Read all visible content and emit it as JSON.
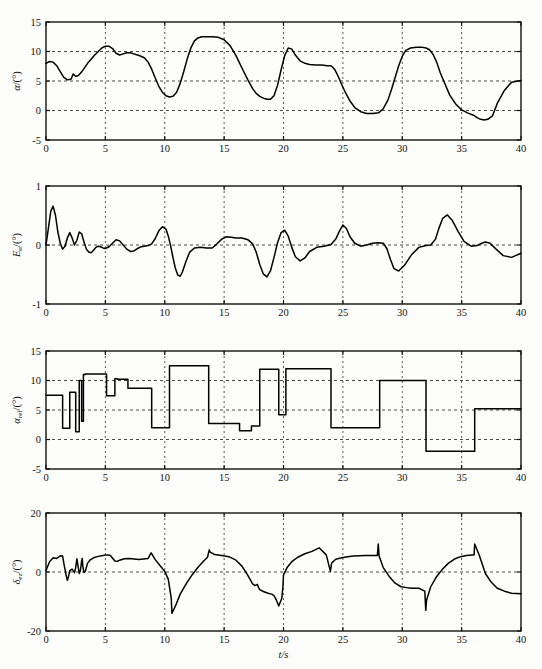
{
  "figure": {
    "width": 542,
    "height": 669,
    "background": "#fdfdfb",
    "line_color": "#000000",
    "grid_color": "#333333",
    "xlabel": "t/s",
    "caption": ""
  },
  "chart_data": [
    {
      "id": "panel-alpha",
      "type": "line",
      "title": "",
      "xlabel": "",
      "ylabel": "α/(°)",
      "ylabel_parts": {
        "base": "α",
        "sub": "",
        "unit": "/(°)"
      },
      "xlim": [
        0,
        40
      ],
      "ylim": [
        -5,
        15
      ],
      "xticks": [
        0,
        5,
        10,
        15,
        20,
        25,
        30,
        35,
        40
      ],
      "yticks": [
        -5,
        0,
        5,
        10,
        15
      ],
      "grid": true,
      "grid_y": [
        0,
        5,
        10
      ],
      "grid_x": [
        5,
        10,
        15,
        20,
        25,
        30,
        35
      ],
      "series": [
        {
          "name": "alpha",
          "x": [
            0.0,
            0.3,
            0.6,
            0.9,
            1.2,
            1.5,
            1.8,
            2.1,
            2.3,
            2.5,
            2.7,
            2.9,
            3.1,
            3.3,
            3.5,
            3.8,
            4.1,
            4.4,
            4.7,
            5.0,
            5.3,
            5.6,
            5.9,
            6.2,
            6.5,
            6.8,
            7.1,
            7.4,
            7.7,
            8.0,
            8.3,
            8.6,
            8.9,
            9.2,
            9.5,
            9.8,
            10.1,
            10.4,
            10.7,
            11.0,
            11.3,
            11.6,
            11.9,
            12.2,
            12.5,
            12.8,
            13.1,
            13.5,
            14.0,
            14.5,
            15.0,
            15.5,
            16.0,
            16.5,
            17.0,
            17.4,
            17.7,
            18.0,
            18.3,
            18.6,
            18.9,
            19.2,
            19.5,
            19.8,
            20.1,
            20.4,
            20.7,
            21.0,
            21.4,
            21.8,
            22.2,
            22.7,
            23.2,
            23.7,
            24.0,
            24.3,
            24.6,
            24.9,
            25.2,
            25.6,
            26.0,
            26.5,
            27.0,
            27.5,
            28.0,
            28.4,
            28.8,
            29.1,
            29.4,
            29.7,
            30.0,
            30.3,
            30.7,
            31.2,
            31.7,
            32.0,
            32.3,
            32.6,
            32.9,
            33.2,
            33.6,
            34.0,
            34.5,
            35.0,
            35.5,
            36.0,
            36.3,
            36.6,
            36.9,
            37.2,
            37.6,
            38.0,
            38.6,
            39.2,
            40.0
          ],
          "y": [
            8.0,
            8.3,
            8.2,
            7.6,
            6.6,
            5.6,
            5.2,
            5.3,
            6.2,
            5.8,
            5.9,
            6.3,
            6.8,
            7.4,
            8.0,
            8.7,
            9.4,
            10.0,
            10.6,
            10.9,
            10.9,
            10.5,
            9.7,
            9.4,
            9.6,
            9.8,
            9.8,
            9.6,
            9.4,
            9.2,
            8.9,
            8.2,
            7.0,
            5.5,
            4.1,
            3.1,
            2.5,
            2.3,
            2.4,
            3.1,
            4.6,
            6.6,
            8.8,
            10.6,
            11.8,
            12.3,
            12.5,
            12.5,
            12.5,
            12.4,
            12.0,
            11.0,
            9.3,
            7.2,
            5.2,
            3.7,
            2.9,
            2.4,
            2.1,
            1.9,
            1.9,
            2.5,
            4.3,
            6.9,
            9.3,
            10.6,
            10.4,
            9.4,
            8.4,
            8.0,
            7.8,
            7.7,
            7.7,
            7.6,
            7.6,
            7.0,
            5.8,
            4.4,
            3.1,
            1.6,
            0.5,
            -0.2,
            -0.5,
            -0.5,
            -0.4,
            0.3,
            1.8,
            3.6,
            5.6,
            7.6,
            9.2,
            10.2,
            10.6,
            10.7,
            10.7,
            10.6,
            10.3,
            9.5,
            8.2,
            6.4,
            4.5,
            2.6,
            1.1,
            0.1,
            -0.4,
            -0.8,
            -1.2,
            -1.5,
            -1.6,
            -1.5,
            -0.9,
            1.2,
            3.4,
            4.8,
            5.1,
            5.1
          ]
        }
      ]
    },
    {
      "id": "panel-error",
      "type": "line",
      "title": "",
      "xlabel": "",
      "ylabel": "Eα/(°)",
      "ylabel_parts": {
        "base": "E",
        "sub": "α",
        "unit": "/(°)"
      },
      "xlim": [
        0,
        40
      ],
      "ylim": [
        -1,
        1
      ],
      "xticks": [
        0,
        5,
        10,
        15,
        20,
        25,
        30,
        35,
        40
      ],
      "yticks": [
        -1,
        0,
        1
      ],
      "grid": true,
      "grid_y": [
        0
      ],
      "grid_x": [
        5,
        10,
        15,
        20,
        25,
        30,
        35
      ],
      "series": [
        {
          "name": "E_alpha",
          "x": [
            0.0,
            0.2,
            0.4,
            0.6,
            0.8,
            1.0,
            1.2,
            1.4,
            1.6,
            1.8,
            2.0,
            2.2,
            2.4,
            2.6,
            2.8,
            3.0,
            3.2,
            3.4,
            3.6,
            3.8,
            4.0,
            4.2,
            4.4,
            4.6,
            4.8,
            5.0,
            5.3,
            5.6,
            5.9,
            6.2,
            6.5,
            6.8,
            7.1,
            7.4,
            7.7,
            8.0,
            8.3,
            8.6,
            8.9,
            9.2,
            9.5,
            9.8,
            10.1,
            10.3,
            10.5,
            10.7,
            10.9,
            11.1,
            11.3,
            11.5,
            11.8,
            12.1,
            12.5,
            13.0,
            13.5,
            14.0,
            14.4,
            14.8,
            15.2,
            15.6,
            16.0,
            16.5,
            17.0,
            17.4,
            17.7,
            18.0,
            18.3,
            18.6,
            18.9,
            19.2,
            19.5,
            19.8,
            20.1,
            20.4,
            20.7,
            21.0,
            21.4,
            21.8,
            22.2,
            22.8,
            23.4,
            24.0,
            24.4,
            24.7,
            25.0,
            25.3,
            25.6,
            26.0,
            26.5,
            27.0,
            27.5,
            28.0,
            28.4,
            28.7,
            29.0,
            29.3,
            29.7,
            30.2,
            30.8,
            31.4,
            32.0,
            32.4,
            32.8,
            33.1,
            33.4,
            33.8,
            34.2,
            34.7,
            35.2,
            35.8,
            36.3,
            36.7,
            37.0,
            37.4,
            37.9,
            38.5,
            39.2,
            40.0
          ],
          "y": [
            0.0,
            0.28,
            0.57,
            0.66,
            0.5,
            0.22,
            0.03,
            -0.07,
            -0.02,
            0.12,
            0.21,
            0.12,
            0.0,
            0.08,
            0.22,
            0.19,
            0.05,
            -0.07,
            -0.12,
            -0.13,
            -0.09,
            -0.04,
            -0.02,
            -0.03,
            -0.05,
            -0.06,
            -0.03,
            0.03,
            0.09,
            0.07,
            0.0,
            -0.07,
            -0.11,
            -0.1,
            -0.06,
            -0.03,
            -0.02,
            -0.01,
            0.02,
            0.11,
            0.24,
            0.31,
            0.27,
            0.15,
            -0.02,
            -0.22,
            -0.4,
            -0.51,
            -0.53,
            -0.45,
            -0.27,
            -0.12,
            -0.05,
            -0.04,
            -0.05,
            -0.05,
            0.02,
            0.1,
            0.14,
            0.13,
            0.12,
            0.12,
            0.09,
            0.02,
            -0.12,
            -0.33,
            -0.49,
            -0.54,
            -0.44,
            -0.21,
            0.04,
            0.21,
            0.25,
            0.15,
            -0.04,
            -0.2,
            -0.27,
            -0.22,
            -0.11,
            -0.04,
            -0.02,
            0.01,
            0.1,
            0.23,
            0.34,
            0.28,
            0.14,
            0.03,
            -0.02,
            0.0,
            0.03,
            0.04,
            0.03,
            -0.06,
            -0.24,
            -0.4,
            -0.44,
            -0.34,
            -0.16,
            -0.04,
            -0.01,
            0.0,
            0.1,
            0.29,
            0.45,
            0.51,
            0.42,
            0.23,
            0.06,
            -0.02,
            -0.01,
            0.03,
            0.05,
            0.03,
            -0.07,
            -0.18,
            -0.21,
            -0.14,
            -0.05,
            -0.01,
            0.0,
            0.0,
            0.0
          ]
        }
      ]
    },
    {
      "id": "panel-alpha-ref",
      "type": "line",
      "title": "",
      "xlabel": "",
      "ylabel": "αref/(°)",
      "ylabel_parts": {
        "base": "α",
        "sub": "ref",
        "unit": "/(°)"
      },
      "xlim": [
        0,
        40
      ],
      "ylim": [
        -5,
        15
      ],
      "xticks": [
        0,
        5,
        10,
        15,
        20,
        25,
        30,
        35,
        40
      ],
      "yticks": [
        -5,
        0,
        5,
        10,
        15
      ],
      "grid": true,
      "grid_y": [
        0,
        5,
        10
      ],
      "grid_x": [
        5,
        10,
        15,
        20,
        25,
        30,
        35
      ],
      "step": true,
      "series": [
        {
          "name": "alpha_ref",
          "x": [
            0.0,
            1.4,
            1.4,
            2.0,
            2.0,
            2.5,
            2.5,
            2.8,
            2.8,
            3.0,
            3.0,
            3.15,
            3.15,
            3.3,
            3.3,
            3.5,
            3.5,
            5.1,
            5.1,
            5.8,
            5.8,
            6.0,
            6.0,
            6.9,
            6.9,
            7.1,
            7.1,
            8.9,
            8.9,
            10.4,
            10.4,
            13.7,
            13.7,
            16.3,
            16.3,
            17.3,
            17.3,
            18.0,
            18.0,
            18.6,
            18.6,
            19.6,
            19.6,
            20.2,
            20.2,
            24.0,
            24.0,
            28.1,
            28.1,
            32.0,
            32.0,
            36.1,
            36.1,
            40.0
          ],
          "y": [
            7.5,
            7.5,
            1.9,
            1.9,
            8.0,
            8.0,
            1.3,
            1.3,
            10.0,
            10.0,
            3.1,
            3.1,
            11.0,
            11.0,
            11.1,
            11.1,
            11.1,
            11.1,
            7.4,
            7.4,
            10.3,
            10.3,
            10.2,
            10.2,
            8.7,
            8.7,
            8.7,
            8.7,
            2.0,
            2.0,
            12.5,
            12.5,
            2.7,
            2.7,
            1.5,
            1.5,
            2.3,
            2.3,
            11.9,
            11.9,
            11.9,
            11.9,
            4.2,
            4.2,
            12.0,
            12.0,
            2.0,
            2.0,
            10.0,
            10.0,
            -2.0,
            -2.0,
            5.2,
            5.2
          ]
        }
      ]
    },
    {
      "id": "panel-delta",
      "type": "line",
      "title": "",
      "xlabel": "t/s",
      "ylabel": "δe/(°)",
      "ylabel_parts": {
        "base": "δ",
        "sub": "ez",
        "unit": "/(°)"
      },
      "xlim": [
        0,
        40
      ],
      "ylim": [
        -20,
        20
      ],
      "xticks": [
        0,
        5,
        10,
        15,
        20,
        25,
        30,
        35,
        40
      ],
      "yticks": [
        -20,
        0,
        20
      ],
      "grid": true,
      "grid_y": [
        0
      ],
      "grid_x": [
        5,
        10,
        15,
        20,
        25,
        30,
        35
      ],
      "series": [
        {
          "name": "delta_e",
          "x": [
            0.0,
            0.3,
            0.6,
            0.9,
            1.2,
            1.4,
            1.5,
            1.7,
            1.8,
            1.9,
            2.0,
            2.2,
            2.4,
            2.5,
            2.6,
            2.7,
            2.8,
            2.9,
            3.0,
            3.05,
            3.1,
            3.2,
            3.3,
            3.4,
            3.5,
            3.7,
            4.0,
            4.4,
            4.8,
            5.0,
            5.05,
            5.4,
            5.8,
            6.0,
            6.2,
            6.6,
            7.0,
            7.4,
            7.8,
            8.2,
            8.6,
            8.85,
            8.9,
            9.2,
            9.6,
            10.0,
            10.3,
            10.55,
            10.6,
            10.9,
            11.3,
            11.8,
            12.3,
            12.8,
            13.3,
            13.6,
            13.75,
            13.8,
            14.2,
            14.8,
            15.4,
            16.0,
            16.5,
            16.9,
            17.2,
            17.4,
            17.6,
            17.8,
            17.9,
            18.0,
            18.3,
            18.7,
            19.0,
            19.2,
            19.4,
            19.6,
            19.85,
            19.95,
            20.0,
            20.3,
            20.7,
            21.2,
            21.8,
            22.4,
            23.0,
            23.6,
            23.95,
            24.05,
            24.4,
            24.9,
            25.4,
            25.9,
            26.4,
            26.9,
            27.4,
            27.9,
            27.98,
            28.05,
            28.4,
            28.9,
            29.4,
            29.9,
            30.4,
            30.9,
            31.4,
            31.9,
            31.98,
            32.05,
            32.4,
            32.9,
            33.4,
            33.9,
            34.4,
            34.9,
            35.4,
            35.9,
            36.05,
            36.1,
            36.5,
            37.0,
            37.5,
            38.0,
            38.6,
            39.2,
            40.0
          ],
          "y": [
            0.5,
            3.5,
            4.8,
            4.6,
            5.5,
            5.4,
            3.0,
            -1.2,
            -2.8,
            -1.5,
            0.5,
            1.0,
            -0.2,
            1.5,
            4.5,
            2.0,
            -0.5,
            0.5,
            3.8,
            4.6,
            2.0,
            -0.2,
            0.2,
            1.5,
            3.0,
            4.0,
            4.8,
            5.3,
            5.6,
            5.8,
            5.8,
            5.7,
            3.7,
            3.6,
            4.0,
            4.5,
            4.6,
            4.4,
            4.2,
            4.4,
            4.6,
            6.5,
            6.2,
            4.2,
            2.2,
            0.2,
            -2.5,
            -9.0,
            -14.0,
            -11.5,
            -7.5,
            -4.0,
            -1.0,
            1.6,
            3.8,
            5.0,
            7.5,
            6.8,
            5.9,
            5.6,
            5.2,
            4.0,
            2.0,
            -0.5,
            -2.6,
            -4.0,
            -4.6,
            -4.2,
            -5.3,
            -6.0,
            -6.6,
            -7.2,
            -7.5,
            -8.0,
            -9.5,
            -11.5,
            -9.0,
            -5.0,
            -1.0,
            1.5,
            3.5,
            5.0,
            6.2,
            7.0,
            8.2,
            5.8,
            0.2,
            3.0,
            4.3,
            4.8,
            5.2,
            5.4,
            5.5,
            5.6,
            5.6,
            5.6,
            9.5,
            5.4,
            1.5,
            -1.5,
            -3.8,
            -5.0,
            -5.3,
            -5.5,
            -5.5,
            -6.5,
            -13.0,
            -9.5,
            -5.0,
            -1.5,
            1.0,
            3.0,
            4.4,
            5.2,
            5.6,
            5.8,
            5.8,
            9.5,
            5.5,
            -0.5,
            -3.5,
            -5.5,
            -6.5,
            -7.2,
            -7.4,
            -7.5,
            -7.5,
            -7.5,
            -7.4,
            -7.4,
            -13.5,
            -9.0,
            -5.0,
            -2.0,
            -0.5,
            0.2,
            0.4,
            0.4
          ]
        }
      ]
    }
  ]
}
